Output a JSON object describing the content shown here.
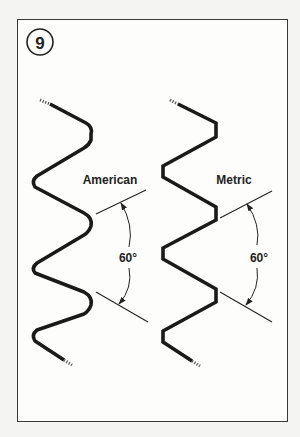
{
  "figure": {
    "number": "9",
    "colors": {
      "page_background": "#f4f4f2",
      "panel_background": "#fdfdfc",
      "border": "#3a3a3a",
      "thread": "#1a1a1a",
      "line": "#222222"
    }
  },
  "profiles": [
    {
      "name": "American",
      "crest_style": "rounded",
      "angle_label": "60°"
    },
    {
      "name": "Metric",
      "crest_style": "flat",
      "angle_label": "60°"
    }
  ]
}
